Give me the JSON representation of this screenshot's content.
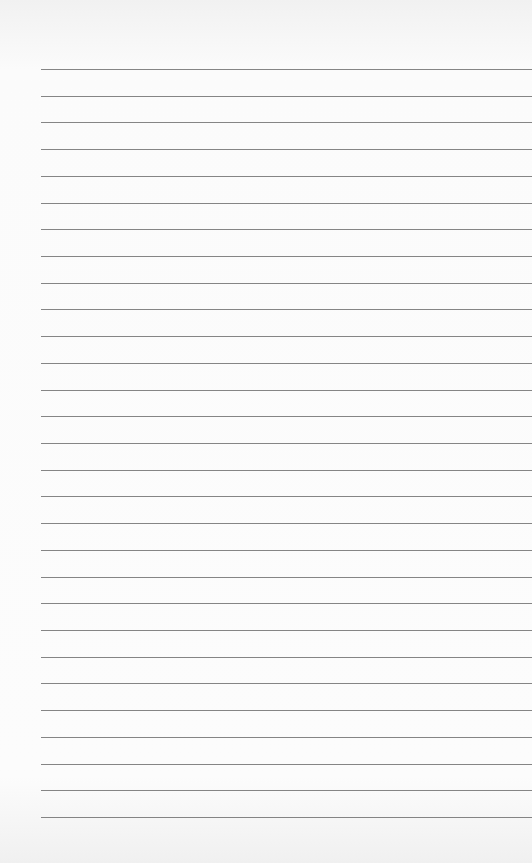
{
  "page": {
    "type": "lined-paper",
    "line_count": 29,
    "line_color": "#707070",
    "paper_color": "#fbfbfb"
  }
}
